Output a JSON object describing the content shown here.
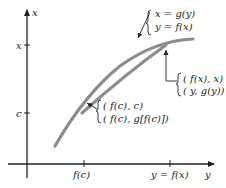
{
  "diagram": {
    "axes": {
      "vertical_label": "x",
      "horizontal_label": "y",
      "vertical_tick_labels": [
        "x",
        "c"
      ],
      "horizontal_tick_labels": [
        "f(c)",
        "y = f(x)"
      ]
    },
    "annotations": {
      "curve": {
        "line1": "x = g(y)",
        "line2": "y = f(x)"
      },
      "point_top": {
        "line1": "( f(x), x)",
        "line2": "( y,  g(y))"
      },
      "point_bottom": {
        "line1": "( f(c), c)",
        "line2": "( f(c),  g[f(c)])"
      }
    },
    "colors": {
      "axis": "#222222",
      "curve": "#8c8c8c",
      "text": "#222222"
    }
  }
}
